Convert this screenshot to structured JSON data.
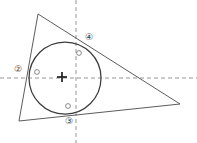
{
  "figure": {
    "width": 197,
    "height": 143,
    "background_color": "#ffffff",
    "stroke_color": "#4a4a4a",
    "dash_color": "#8a8a8a",
    "label_color": "#3a3a3a"
  },
  "triangle": {
    "name": "circumscribed-triangle",
    "vertices": [
      {
        "name": "apex-top-left",
        "x": 38,
        "y": 14
      },
      {
        "name": "vertex-right",
        "x": 180,
        "y": 104
      },
      {
        "name": "vertex-bottom-left",
        "x": 19,
        "y": 121
      }
    ],
    "points_attr": "38,14 180,104 19,121"
  },
  "incircle": {
    "name": "inscribed-circle",
    "cx": 65,
    "cy": 78,
    "r": 36
  },
  "axes": {
    "horizontal": {
      "name": "horizontal-dashed-axis",
      "x1": 0,
      "y1": 78,
      "x2": 197,
      "y2": 78
    },
    "vertical": {
      "name": "vertical-dashed-axis",
      "x1": 76,
      "y1": 0,
      "x2": 76,
      "y2": 143
    }
  },
  "center_mark": {
    "name": "center-cross-mark",
    "x": 62,
    "y": 77,
    "arm": 5
  },
  "labels": [
    {
      "id": "label-2",
      "text": "②",
      "x": 18,
      "y": 70
    },
    {
      "id": "label-4",
      "text": "④",
      "x": 89,
      "y": 38
    },
    {
      "id": "label-3",
      "text": "③",
      "x": 69,
      "y": 122
    }
  ],
  "tangent_markers": [
    {
      "id": "marker-left",
      "cx": 37,
      "cy": 72,
      "r": 2.4
    },
    {
      "id": "marker-upper-right",
      "cx": 79,
      "cy": 53,
      "r": 2.4
    },
    {
      "id": "marker-bottom",
      "cx": 68,
      "cy": 106,
      "r": 2.4
    }
  ]
}
